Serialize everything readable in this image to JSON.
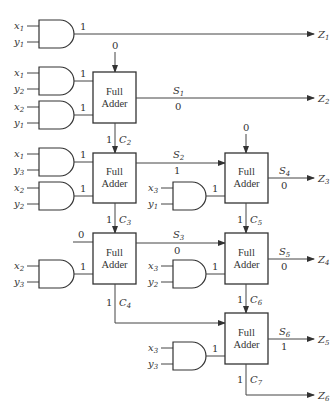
{
  "diagram": {
    "type": "combinational multiplier circuit (3x2 partial products with full adders)",
    "full_adder_label_line1": "Full",
    "full_adder_label_line2": "Adder",
    "full_adders": [
      {
        "id": "FA1",
        "carry_in": "0",
        "sum_label": "S",
        "sum_sub": "1",
        "sum_value": "0",
        "sum_output": "Z",
        "sum_output_sub": "2",
        "carry_label": "C",
        "carry_sub": "2",
        "carry_value": "1"
      },
      {
        "id": "FA2",
        "sum_label": "S",
        "sum_sub": "2",
        "sum_value": "1",
        "carry_label": "C",
        "carry_sub": "3",
        "carry_value": "1"
      },
      {
        "id": "FA3",
        "extra_input": "0",
        "sum_label": "S",
        "sum_sub": "3",
        "sum_value": "0",
        "carry_label": "C",
        "carry_sub": "4",
        "carry_value": "1"
      },
      {
        "id": "FA4",
        "carry_in": "0",
        "sum_label": "S",
        "sum_sub": "4",
        "sum_value": "0",
        "sum_output": "Z",
        "sum_output_sub": "3",
        "carry_label": "C",
        "carry_sub": "5",
        "carry_value": "1"
      },
      {
        "id": "FA5",
        "sum_label": "S",
        "sum_sub": "5",
        "sum_value": "0",
        "sum_output": "Z",
        "sum_output_sub": "4",
        "carry_label": "C",
        "carry_sub": "6",
        "carry_value": "1"
      },
      {
        "id": "FA6",
        "sum_label": "S",
        "sum_sub": "6",
        "sum_value": "1",
        "sum_output": "Z",
        "sum_output_sub": "5",
        "carry_label": "C",
        "carry_sub": "7",
        "carry_value": "1",
        "carry_output": "Z",
        "carry_output_sub": "6"
      }
    ],
    "and_gates": [
      {
        "a": "x",
        "a_sub": "1",
        "b": "y",
        "b_sub": "1",
        "out": "1",
        "to": "Z1"
      },
      {
        "a": "x",
        "a_sub": "1",
        "b": "y",
        "b_sub": "2",
        "out": "1",
        "to": "FA1"
      },
      {
        "a": "x",
        "a_sub": "2",
        "b": "y",
        "b_sub": "1",
        "out": "1",
        "to": "FA1"
      },
      {
        "a": "x",
        "a_sub": "1",
        "b": "y",
        "b_sub": "3",
        "out": "1",
        "to": "FA2"
      },
      {
        "a": "x",
        "a_sub": "2",
        "b": "y",
        "b_sub": "2",
        "out": "1",
        "to": "FA2"
      },
      {
        "a": "x",
        "a_sub": "3",
        "b": "y",
        "b_sub": "1",
        "out": "1",
        "to": "FA4"
      },
      {
        "a": "x",
        "a_sub": "2",
        "b": "y",
        "b_sub": "3",
        "out": "1",
        "to": "FA3"
      },
      {
        "a": "x",
        "a_sub": "3",
        "b": "y",
        "b_sub": "2",
        "out": "1",
        "to": "FA5"
      },
      {
        "a": "x",
        "a_sub": "3",
        "b": "y",
        "b_sub": "3",
        "out": "1",
        "to": "FA6"
      }
    ],
    "outputs": [
      {
        "label": "Z",
        "sub": "1"
      },
      {
        "label": "Z",
        "sub": "2"
      },
      {
        "label": "Z",
        "sub": "3"
      },
      {
        "label": "Z",
        "sub": "4"
      },
      {
        "label": "Z",
        "sub": "5"
      },
      {
        "label": "Z",
        "sub": "6"
      }
    ],
    "z1_value": "1"
  }
}
